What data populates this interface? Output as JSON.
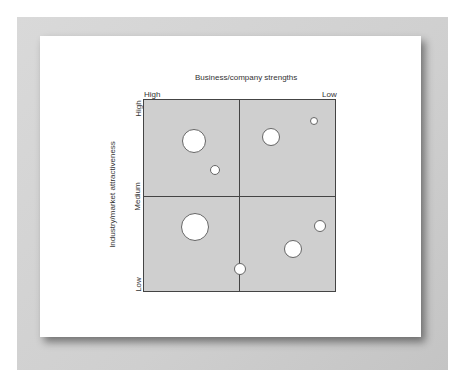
{
  "diagram": {
    "title": "Business/company strengths",
    "x_axis": {
      "high_label": "High",
      "low_label": "Low"
    },
    "y_axis": {
      "title": "Industry/market attractiveness",
      "high_label": "High",
      "medium_label": "Medium",
      "low_label": "Low"
    },
    "colors": {
      "grid_fill": "#cfcfcf",
      "grid_lines": "#444444",
      "bubble_fill": "#ffffff",
      "frame": "#d0d0d0"
    },
    "bubbles": [
      {
        "quadrant": "top-left",
        "cx": 194,
        "cy": 141,
        "r": 12
      },
      {
        "quadrant": "top-left",
        "cx": 215,
        "cy": 170,
        "r": 5
      },
      {
        "quadrant": "top-right",
        "cx": 271,
        "cy": 137,
        "r": 9
      },
      {
        "quadrant": "top-right",
        "cx": 314,
        "cy": 121,
        "r": 4
      },
      {
        "quadrant": "bottom-left",
        "cx": 195,
        "cy": 227,
        "r": 14
      },
      {
        "quadrant": "bottom-right",
        "cx": 293,
        "cy": 249,
        "r": 9
      },
      {
        "quadrant": "bottom-right",
        "cx": 320,
        "cy": 226,
        "r": 6
      },
      {
        "quadrant": "bottom-center-line",
        "cx": 240,
        "cy": 269,
        "r": 6
      }
    ]
  }
}
